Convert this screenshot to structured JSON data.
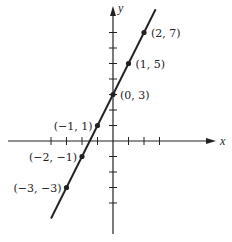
{
  "figure": {
    "type": "line-graph",
    "equation_implied": "y = 2x + 3",
    "axes": {
      "x_label": "x",
      "y_label": "y",
      "x_ticks": [
        -4,
        -3,
        -2,
        -1,
        1,
        2,
        3
      ],
      "y_ticks": [
        -4,
        -3,
        -2,
        -1,
        1,
        2,
        3,
        4,
        5,
        6,
        7
      ]
    },
    "points": [
      {
        "x": 2,
        "y": 7,
        "label": "(2, 7)",
        "label_side": "right"
      },
      {
        "x": 1,
        "y": 5,
        "label": "(1, 5)",
        "label_side": "right"
      },
      {
        "x": 0,
        "y": 3,
        "label": "(0, 3)",
        "label_side": "right"
      },
      {
        "x": -1,
        "y": 1,
        "label": "(−1, 1)",
        "label_side": "left"
      },
      {
        "x": -2,
        "y": -1,
        "label": "(−2, −1)",
        "label_side": "left"
      },
      {
        "x": -3,
        "y": -3,
        "label": "(−3, −3)",
        "label_side": "left"
      }
    ],
    "line_extent": {
      "x_start": -4,
      "x_end": 2.75
    },
    "colors": {
      "ink": "#222222",
      "background": "#ffffff"
    }
  },
  "chart_data": {
    "type": "line",
    "title": "",
    "xlabel": "x",
    "ylabel": "y",
    "x": [
      -3,
      -2,
      -1,
      0,
      1,
      2
    ],
    "series": [
      {
        "name": "y = 2x + 3",
        "values": [
          -3,
          -1,
          1,
          3,
          5,
          7
        ]
      }
    ],
    "annotations": [
      "(2, 7)",
      "(1, 5)",
      "(0, 3)",
      "(−1, 1)",
      "(−2, −1)",
      "(−3, −3)"
    ],
    "xlim": [
      -6.5,
      6.5
    ],
    "ylim": [
      -6.5,
      8.5
    ],
    "grid": false,
    "legend": "none"
  }
}
